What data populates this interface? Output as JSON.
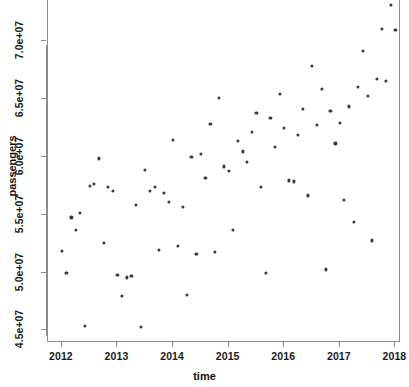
{
  "chart_data": {
    "type": "scatter",
    "title": "",
    "xlabel": "time",
    "ylabel": "passengers",
    "xlim": [
      2011.75,
      2018.1
    ],
    "ylim": [
      44000000,
      73500000
    ],
    "grid": false,
    "legend": null,
    "xticks": [
      2012,
      2013,
      2014,
      2015,
      2016,
      2017,
      2018
    ],
    "xticklabels": [
      "2012",
      "2013",
      "2014",
      "2015",
      "2016",
      "2017",
      "2018"
    ],
    "yticks": [
      45000000,
      50000000,
      55000000,
      60000000,
      65000000,
      70000000
    ],
    "yticklabels": [
      "4.5e+07",
      "5.0e+07",
      "5.5e+07",
      "6.0e+07",
      "6.5e+07",
      "7.0e+07"
    ],
    "marker": {
      "shape": "circle",
      "color": "#3b3b3b",
      "size": 3
    },
    "points": [
      {
        "x": 2012.0,
        "y": 51800000
      },
      {
        "x": 2012.08,
        "y": 49900000
      },
      {
        "x": 2012.17,
        "y": 54700000
      },
      {
        "x": 2012.25,
        "y": 53600000
      },
      {
        "x": 2012.33,
        "y": 55100000
      },
      {
        "x": 2012.42,
        "y": 45300000
      },
      {
        "x": 2012.5,
        "y": 57400000
      },
      {
        "x": 2012.58,
        "y": 57600000
      },
      {
        "x": 2012.67,
        "y": 59800000
      },
      {
        "x": 2012.75,
        "y": 52500000
      },
      {
        "x": 2012.83,
        "y": 57300000
      },
      {
        "x": 2012.92,
        "y": 57000000
      },
      {
        "x": 2013.0,
        "y": 49700000
      },
      {
        "x": 2013.08,
        "y": 47900000
      },
      {
        "x": 2013.17,
        "y": 49500000
      },
      {
        "x": 2013.25,
        "y": 49600000
      },
      {
        "x": 2013.33,
        "y": 55800000
      },
      {
        "x": 2013.42,
        "y": 45200000
      },
      {
        "x": 2013.5,
        "y": 58800000
      },
      {
        "x": 2013.58,
        "y": 57000000
      },
      {
        "x": 2013.67,
        "y": 57300000
      },
      {
        "x": 2013.75,
        "y": 51900000
      },
      {
        "x": 2013.83,
        "y": 56800000
      },
      {
        "x": 2013.92,
        "y": 56000000
      },
      {
        "x": 2014.0,
        "y": 61400000
      },
      {
        "x": 2014.08,
        "y": 52200000
      },
      {
        "x": 2014.17,
        "y": 55600000
      },
      {
        "x": 2014.25,
        "y": 48000000
      },
      {
        "x": 2014.33,
        "y": 59900000
      },
      {
        "x": 2014.42,
        "y": 51500000
      },
      {
        "x": 2014.5,
        "y": 60200000
      },
      {
        "x": 2014.58,
        "y": 58100000
      },
      {
        "x": 2014.67,
        "y": 62800000
      },
      {
        "x": 2014.75,
        "y": 51700000
      },
      {
        "x": 2014.83,
        "y": 65000000
      },
      {
        "x": 2014.92,
        "y": 59100000
      },
      {
        "x": 2015.0,
        "y": 58700000
      },
      {
        "x": 2015.08,
        "y": 53600000
      },
      {
        "x": 2015.17,
        "y": 61300000
      },
      {
        "x": 2015.25,
        "y": 60400000
      },
      {
        "x": 2015.33,
        "y": 59500000
      },
      {
        "x": 2015.42,
        "y": 62100000
      },
      {
        "x": 2015.5,
        "y": 63700000
      },
      {
        "x": 2015.58,
        "y": 57300000
      },
      {
        "x": 2015.67,
        "y": 49900000
      },
      {
        "x": 2015.75,
        "y": 63300000
      },
      {
        "x": 2015.83,
        "y": 60800000
      },
      {
        "x": 2015.92,
        "y": 65400000
      },
      {
        "x": 2016.0,
        "y": 62400000
      },
      {
        "x": 2016.08,
        "y": 57900000
      },
      {
        "x": 2016.17,
        "y": 57800000
      },
      {
        "x": 2016.25,
        "y": 61800000
      },
      {
        "x": 2016.33,
        "y": 64100000
      },
      {
        "x": 2016.42,
        "y": 56600000
      },
      {
        "x": 2016.5,
        "y": 67800000
      },
      {
        "x": 2016.58,
        "y": 62700000
      },
      {
        "x": 2016.67,
        "y": 65800000
      },
      {
        "x": 2016.75,
        "y": 50200000
      },
      {
        "x": 2016.83,
        "y": 63900000
      },
      {
        "x": 2016.92,
        "y": 61100000
      },
      {
        "x": 2017.0,
        "y": 62900000
      },
      {
        "x": 2017.08,
        "y": 56200000
      },
      {
        "x": 2017.17,
        "y": 64300000
      },
      {
        "x": 2017.25,
        "y": 54300000
      },
      {
        "x": 2017.33,
        "y": 66000000
      },
      {
        "x": 2017.42,
        "y": 69100000
      },
      {
        "x": 2017.5,
        "y": 65200000
      },
      {
        "x": 2017.58,
        "y": 52700000
      },
      {
        "x": 2017.67,
        "y": 66700000
      },
      {
        "x": 2017.75,
        "y": 71000000
      },
      {
        "x": 2017.83,
        "y": 66500000
      },
      {
        "x": 2017.92,
        "y": 73100000
      },
      {
        "x": 2018.0,
        "y": 70900000
      }
    ]
  }
}
